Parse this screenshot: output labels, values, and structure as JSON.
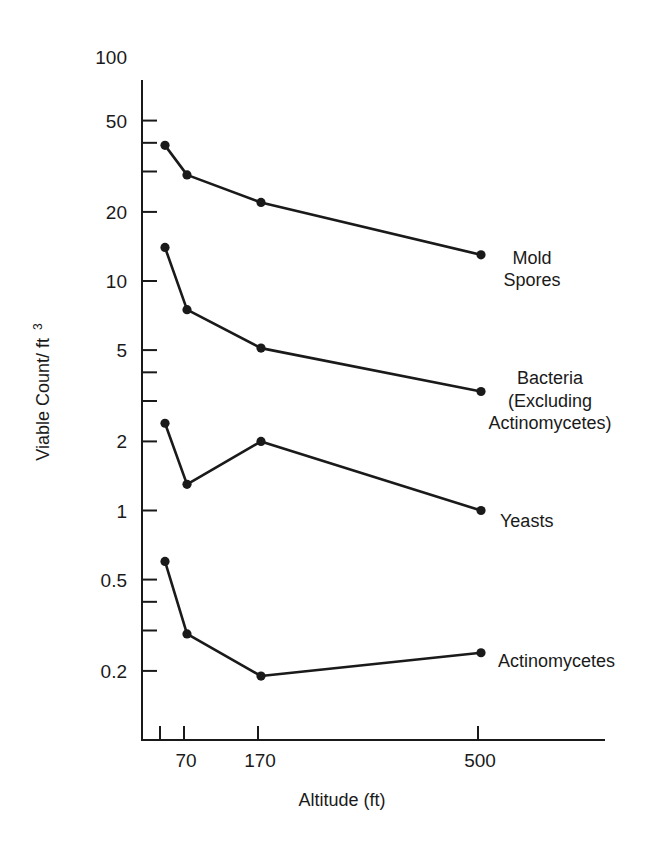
{
  "chart_data": {
    "type": "line",
    "title": "",
    "xlabel": "Altitude (ft)",
    "ylabel": "Viable Count/ ft",
    "ylabel_superscript": "3",
    "yscale": "log",
    "ylim": [
      0.1,
      100
    ],
    "grid": false,
    "legend_position": "inline labels at right end of each series",
    "x": [
      30,
      70,
      170,
      500
    ],
    "x_tick_labels": [
      "",
      "70",
      "170",
      "500"
    ],
    "y_tick_labels": [
      "100",
      "50",
      "20",
      "10",
      "5",
      "2",
      "1",
      "0.5",
      "0.2"
    ],
    "y_minor_ticks": [
      40,
      30,
      4,
      3,
      0.4,
      0.3
    ],
    "series": [
      {
        "name": "Mold Spores",
        "label_lines": [
          "Mold",
          "Spores"
        ],
        "values": [
          39,
          29,
          22,
          13
        ]
      },
      {
        "name": "Bacteria (Excluding Actinomycetes)",
        "label_lines": [
          "Bacteria",
          "(Excluding",
          "Actinomycetes)"
        ],
        "values": [
          14,
          7.5,
          5.1,
          3.3
        ]
      },
      {
        "name": "Yeasts",
        "label_lines": [
          "Yeasts"
        ],
        "values": [
          2.4,
          1.3,
          2.0,
          1.0
        ]
      },
      {
        "name": "Actinomycetes",
        "label_lines": [
          "Actinomycetes"
        ],
        "values": [
          0.6,
          0.29,
          0.19,
          0.24
        ]
      }
    ]
  }
}
